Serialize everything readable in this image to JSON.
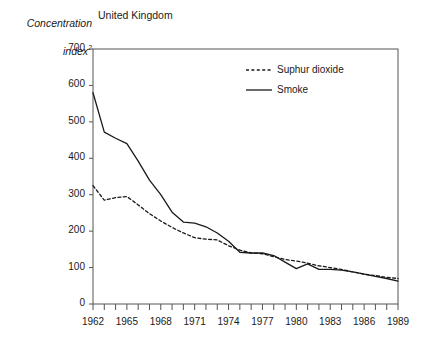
{
  "chart_data": {
    "type": "line",
    "title": "United Kingdom",
    "ylabel_line1": "Concentration",
    "ylabel_line2": "index",
    "ylabel_superscript": "2",
    "xlabel": "",
    "xlim": [
      1962,
      1989
    ],
    "ylim": [
      0,
      700
    ],
    "ytick_values": [
      0,
      100,
      200,
      300,
      400,
      500,
      600,
      700
    ],
    "ytick_labels": [
      "0",
      "100",
      "200",
      "300",
      "400",
      "500",
      "600",
      "700"
    ],
    "xtick_years": [
      1962,
      1963,
      1964,
      1965,
      1966,
      1967,
      1968,
      1969,
      1970,
      1971,
      1972,
      1973,
      1974,
      1975,
      1976,
      1977,
      1978,
      1979,
      1980,
      1981,
      1982,
      1983,
      1984,
      1985,
      1986,
      1987,
      1988,
      1989
    ],
    "xtick_labels": [
      "1962",
      "1965",
      "1968",
      "1971",
      "1974",
      "1977",
      "1980",
      "1983",
      "1986",
      "1989"
    ],
    "xtick_label_years": [
      1962,
      1965,
      1968,
      1971,
      1974,
      1977,
      1980,
      1983,
      1986,
      1989
    ],
    "grid": false,
    "legend_position": "top-right-inside",
    "x": [
      1962,
      1963,
      1964,
      1965,
      1966,
      1967,
      1968,
      1969,
      1970,
      1971,
      1972,
      1973,
      1974,
      1975,
      1976,
      1977,
      1978,
      1979,
      1980,
      1981,
      1982,
      1983,
      1984,
      1985,
      1986,
      1987,
      1988,
      1989
    ],
    "series": [
      {
        "name": "Suphur dioxide",
        "style": "dashed",
        "color": "#1a1a1a",
        "values": [
          325,
          285,
          292,
          295,
          272,
          248,
          228,
          210,
          195,
          182,
          178,
          176,
          160,
          148,
          140,
          138,
          130,
          122,
          118,
          112,
          105,
          100,
          95,
          88,
          82,
          78,
          73,
          70
        ]
      },
      {
        "name": "Smoke",
        "style": "solid",
        "color": "#1a1a1a",
        "values": [
          580,
          472,
          455,
          440,
          392,
          340,
          300,
          252,
          225,
          222,
          212,
          195,
          172,
          142,
          140,
          140,
          133,
          115,
          97,
          110,
          95,
          95,
          93,
          88,
          82,
          76,
          70,
          63
        ]
      }
    ]
  },
  "legend": {
    "entries": [
      {
        "label": "Suphur dioxide",
        "marker": "dashed-line-swatch"
      },
      {
        "label": "Smoke",
        "marker": "solid-line-swatch"
      }
    ]
  }
}
